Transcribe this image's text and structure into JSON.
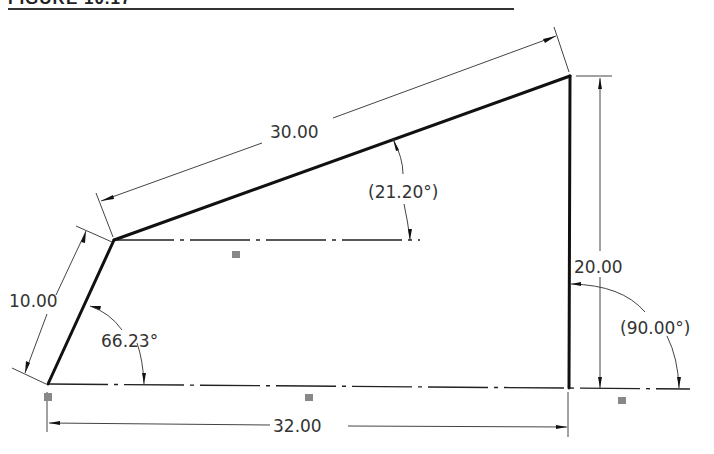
{
  "figure": {
    "title": "FIGURE 10.17",
    "type": "SolidWorks sketch drawing"
  },
  "sketch": {
    "vertices": [
      {
        "id": "A",
        "x": 48,
        "y": 384
      },
      {
        "id": "B",
        "x": 114,
        "y": 240
      },
      {
        "id": "C",
        "x": 570,
        "y": 76
      },
      {
        "id": "D",
        "x": 569,
        "y": 388
      }
    ],
    "segments": [
      {
        "from": "A",
        "to": "B",
        "kind": "solid"
      },
      {
        "from": "B",
        "to": "C",
        "kind": "solid"
      },
      {
        "from": "C",
        "to": "D",
        "kind": "solid"
      },
      {
        "from": "A",
        "to": "D",
        "kind": "centerline"
      },
      {
        "from": "B",
        "to": "H",
        "kind": "centerline"
      }
    ]
  },
  "dimensions": {
    "left_edge": {
      "value": "10.00"
    },
    "top_edge": {
      "value": "30.00"
    },
    "right_edge": {
      "value": "20.00"
    },
    "bottom_edge": {
      "value": "32.00"
    },
    "angle_left": {
      "value": "66.23°"
    },
    "angle_top": {
      "value": "(21.20°)",
      "driven": true
    },
    "angle_right": {
      "value": "(90.00°)",
      "driven": true
    }
  },
  "relations": {
    "horizontal_icons": [
      "horizontal-relation",
      "horizontal-relation",
      "horizontal-relation"
    ],
    "fixed_icon": "fixed-relation"
  },
  "colors": {
    "geometry": "#111111",
    "dimension": "#444444",
    "text": "#333333",
    "background": "#ffffff"
  }
}
